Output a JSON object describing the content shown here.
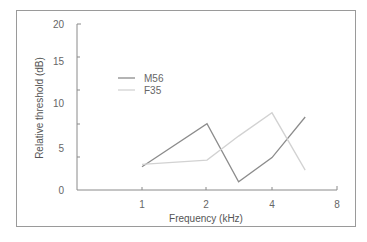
{
  "chart_data": {
    "type": "line",
    "title": "",
    "xlabel": "Frequency (kHz)",
    "ylabel": "Relative threshold (dB)",
    "x_scale": "log2",
    "x_ticks": [
      1,
      2,
      4,
      8
    ],
    "y_ticks": [
      0,
      5,
      10,
      15,
      20
    ],
    "xlim": [
      0.5,
      8
    ],
    "ylim": [
      0,
      20
    ],
    "grid": false,
    "legend_position": "upper-left inside",
    "x": [
      1,
      1.4,
      2,
      2.8,
      4,
      5.7
    ],
    "series": [
      {
        "name": "M56",
        "color": "#8c8c8c",
        "x": [
          1,
          2,
          2.8,
          4,
          5.7
        ],
        "values": [
          2.8,
          8.0,
          1.0,
          3.9,
          8.8
        ]
      },
      {
        "name": "F35",
        "color": "#d2d2d2",
        "x": [
          1,
          2,
          2.8,
          4,
          5.7
        ],
        "values": [
          3.1,
          3.6,
          6.5,
          9.3,
          2.4
        ]
      }
    ]
  },
  "legend": {
    "items": [
      {
        "label": "M56"
      },
      {
        "label": "F35"
      }
    ]
  },
  "axes": {
    "y_title": "Relative threshold (dB)",
    "x_title": "Frequency (kHz)",
    "y_labels": [
      "20",
      "15",
      "10",
      "5",
      "0"
    ],
    "x_labels": [
      "1",
      "2",
      "4",
      "8"
    ]
  }
}
